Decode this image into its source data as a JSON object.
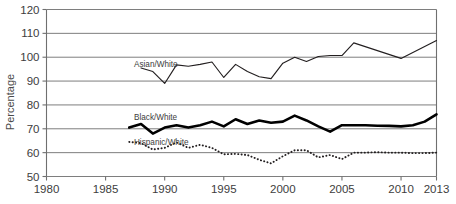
{
  "chart_data": {
    "type": "line",
    "title": "",
    "xlabel": "",
    "ylabel": "Percentage",
    "xlim": [
      1980,
      2013
    ],
    "ylim": [
      50,
      120
    ],
    "grid": true,
    "grid_axis": "y",
    "legend": "inline-labels",
    "x_ticks": [
      "1980",
      "1985",
      "1990",
      "1995",
      "2000",
      "2005",
      "2010",
      "2013"
    ],
    "x_tick_values": [
      1980,
      1985,
      1990,
      1995,
      2000,
      2005,
      2010,
      2013
    ],
    "y_ticks": [
      "50",
      "60",
      "70",
      "80",
      "90",
      "100",
      "110",
      "120"
    ],
    "y_tick_values": [
      50,
      60,
      70,
      80,
      90,
      100,
      110,
      120
    ],
    "series": [
      {
        "name": "Asian/White",
        "style": "solid-thin",
        "color": "#231f20",
        "label_x": 1987.4,
        "label_y": 97.0,
        "x": [
          1988,
          1989,
          1990,
          1991,
          1992,
          1993,
          1994,
          1995,
          1996,
          1997,
          1998,
          1999,
          2000,
          2001,
          2002,
          2003,
          2004,
          2005,
          2006,
          2010,
          2013
        ],
        "values": [
          95.5,
          94.0,
          89.0,
          96.8,
          96.2,
          97.0,
          98.0,
          91.5,
          97.0,
          94.0,
          91.8,
          91.0,
          97.5,
          100.0,
          98.2,
          100.3,
          100.7,
          100.7,
          106.0,
          99.5,
          107.0
        ]
      },
      {
        "name": "Black/White",
        "style": "solid-thick",
        "color": "#000000",
        "label_x": 1987.4,
        "label_y": 75.0,
        "x": [
          1987,
          1988,
          1989,
          1990,
          1991,
          1992,
          1993,
          1994,
          1995,
          1996,
          1997,
          1998,
          1999,
          2000,
          2001,
          2002,
          2003,
          2004,
          2005,
          2006,
          2007,
          2008,
          2009,
          2010,
          2011,
          2012,
          2013
        ],
        "values": [
          70.5,
          72.0,
          68.0,
          70.5,
          71.5,
          70.5,
          71.5,
          73.0,
          71.0,
          74.0,
          72.0,
          73.5,
          72.5,
          73.0,
          75.5,
          73.5,
          71.0,
          68.8,
          71.5,
          71.5,
          71.5,
          71.3,
          71.2,
          71.0,
          71.5,
          73.0,
          76.0
        ]
      },
      {
        "name": "Hispanic/White",
        "style": "dotted",
        "color": "#231f20",
        "label_x": 1987.4,
        "label_y": 64.5,
        "x": [
          1987,
          1988,
          1989,
          1990,
          1991,
          1992,
          1993,
          1994,
          1995,
          1996,
          1997,
          1998,
          1999,
          2000,
          2001,
          2002,
          2003,
          2004,
          2005,
          2006,
          2007,
          2008,
          2009,
          2010,
          2011,
          2012,
          2013
        ],
        "values": [
          64.5,
          64.0,
          61.3,
          62.0,
          64.3,
          62.0,
          63.3,
          62.0,
          59.3,
          59.5,
          59.0,
          57.0,
          55.5,
          58.5,
          61.0,
          61.0,
          58.0,
          59.0,
          57.3,
          60.0,
          60.0,
          60.2,
          60.0,
          60.0,
          59.8,
          59.8,
          60.0
        ]
      }
    ]
  }
}
